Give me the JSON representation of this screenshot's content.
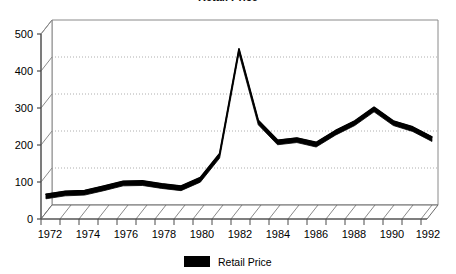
{
  "chart_data": {
    "type": "line",
    "title": "Retail Price",
    "subtitle": "",
    "xlabel": "",
    "ylabel": "",
    "x": [
      1972,
      1973,
      1974,
      1975,
      1976,
      1977,
      1978,
      1979,
      1980,
      1981,
      1982,
      1983,
      1984,
      1985,
      1986,
      1987,
      1988,
      1989,
      1990,
      1991,
      1992
    ],
    "categories": [
      "1972",
      "1973",
      "1974",
      "1975",
      "1976",
      "1977",
      "1978",
      "1979",
      "1980",
      "1981",
      "1982",
      "1983",
      "1984",
      "1985",
      "1986",
      "1987",
      "1988",
      "1989",
      "1990",
      "1991",
      "1992"
    ],
    "series": [
      {
        "name": "Retail Price",
        "color": "#000000",
        "values": [
          50,
          58,
          60,
          72,
          85,
          86,
          78,
          72,
          95,
          160,
          443,
          250,
          196,
          202,
          190,
          222,
          248,
          285,
          248,
          232,
          205
        ]
      }
    ],
    "ylim": [
      0,
      500
    ],
    "yticks": [
      0,
      100,
      200,
      300,
      400,
      500
    ],
    "ytick_labels": [
      "0",
      "100",
      "200",
      "300",
      "400",
      "500"
    ],
    "xlim": [
      1972,
      1992
    ],
    "xticks": [
      1972,
      1974,
      1976,
      1978,
      1980,
      1982,
      1984,
      1986,
      1988,
      1990,
      1992
    ],
    "xtick_labels": [
      "1972",
      "1974",
      "1976",
      "1978",
      "1980",
      "1982",
      "1984",
      "1986",
      "1988",
      "1990",
      "1992"
    ],
    "grid": true,
    "grid_style": "dotted",
    "grid_color": "#9a9a9a",
    "legend_position": "bottom-center",
    "legend": [
      {
        "label": "Retail Price",
        "color": "#000000"
      }
    ],
    "style": "3d-perspective",
    "plot_background": "#ffffff",
    "axis_color": "#555555",
    "floor_hatched": true
  }
}
